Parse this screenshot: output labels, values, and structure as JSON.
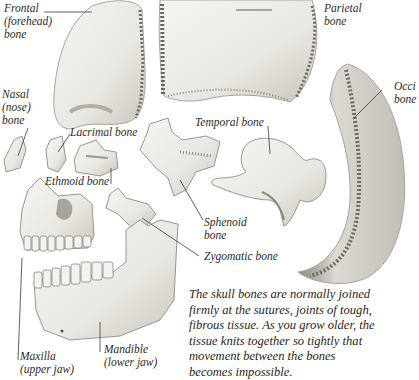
{
  "diagram": {
    "colors": {
      "background": "#ffffff",
      "bone_fill": "#ecebe6",
      "bone_shade": "#bdb9b1",
      "suture_dark": "#6f6a63",
      "leader_line": "#3a3a3a",
      "text": "#2f2a26"
    }
  },
  "labels": {
    "frontal": {
      "line1": "Frontal",
      "line2": "(forehead)",
      "line3": "bone"
    },
    "parietal": {
      "line1": "Parietal",
      "line2": "bone"
    },
    "occipital": {
      "line1": "Occi",
      "line2": "bone"
    },
    "nasal": {
      "line1": "Nasal",
      "line2": "(nose)",
      "line3": "bone"
    },
    "lacrimal": {
      "line1": "Lacrimal bone"
    },
    "ethmoid": {
      "line1": "Ethmoid bone"
    },
    "temporal": {
      "line1": "Temporal bone"
    },
    "sphenoid": {
      "line1": "Sphenoid",
      "line2": "bone"
    },
    "zygomatic": {
      "line1": "Zygomatic bone"
    },
    "maxilla": {
      "line1": "Maxilla",
      "line2": "(upper jaw)"
    },
    "mandible": {
      "line1": "Mandible",
      "line2": "(lower jaw)"
    }
  },
  "caption": {
    "lines": [
      "The skull bones are normally joined",
      "firmly at the sutures, joints of tough,",
      "fibrous tissue. As you grow older, the",
      "tissue knits together so tightly that",
      "movement between the bones",
      "becomes impossible."
    ]
  }
}
